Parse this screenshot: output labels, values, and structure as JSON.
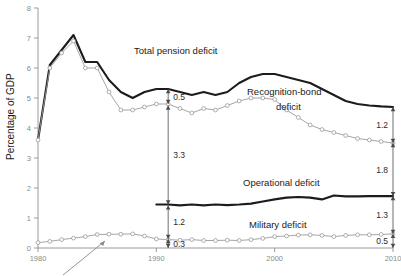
{
  "chart_data": {
    "type": "line",
    "title": "",
    "xlabel": "",
    "ylabel": "Percentage of GDP",
    "xlim": [
      1980,
      2010
    ],
    "ylim": [
      0,
      8
    ],
    "ytick_labels": [
      "0",
      "1",
      "2",
      "3",
      "4",
      "5",
      "6",
      "7",
      "8"
    ],
    "ytick_values": [
      0,
      1,
      2,
      3,
      4,
      5,
      6,
      7,
      8
    ],
    "xtick_labels": [
      "1980",
      "1990",
      "2000",
      "2010"
    ],
    "xtick_values": [
      1980,
      1990,
      2000,
      2010
    ],
    "grid": false,
    "legend_position": "inline-annotations",
    "x": [
      1980,
      1981,
      1982,
      1983,
      1984,
      1985,
      1986,
      1987,
      1988,
      1989,
      1990,
      1991,
      1992,
      1993,
      1994,
      1995,
      1996,
      1997,
      1998,
      1999,
      2000,
      2001,
      2002,
      2003,
      2004,
      2005,
      2006,
      2007,
      2008,
      2009,
      2010
    ],
    "series": [
      {
        "name": "Total pension deficit",
        "style": "thick-black",
        "values": [
          3.6,
          6.1,
          6.6,
          7.1,
          6.2,
          6.2,
          5.6,
          5.2,
          5.0,
          5.2,
          5.3,
          5.3,
          5.2,
          5.1,
          5.2,
          5.1,
          5.2,
          5.5,
          5.7,
          5.8,
          5.8,
          5.7,
          5.6,
          5.5,
          5.3,
          5.1,
          4.9,
          4.8,
          4.75,
          4.72,
          4.7
        ]
      },
      {
        "name": "Recognition-bond deficit",
        "style": "thin-grey-markers",
        "values": [
          3.6,
          6.0,
          6.5,
          6.9,
          6.0,
          6.0,
          5.2,
          4.6,
          4.6,
          4.7,
          4.8,
          4.8,
          4.65,
          4.5,
          4.65,
          4.6,
          4.75,
          4.9,
          5.0,
          5.0,
          4.95,
          4.6,
          4.35,
          4.1,
          3.95,
          3.85,
          3.75,
          3.65,
          3.6,
          3.55,
          3.5
        ]
      },
      {
        "name": "Operational deficit / Military deficit boundary",
        "style": "thick-black",
        "values": [
          null,
          null,
          null,
          null,
          null,
          null,
          null,
          null,
          null,
          null,
          1.45,
          1.45,
          1.42,
          1.45,
          1.42,
          1.45,
          1.43,
          1.45,
          1.48,
          1.55,
          1.62,
          1.68,
          1.7,
          1.68,
          1.62,
          1.75,
          1.72,
          1.72,
          1.73,
          1.73,
          1.73
        ]
      },
      {
        "name": "Military deficit",
        "style": "thin-grey-markers",
        "values": [
          0.18,
          0.22,
          0.28,
          0.33,
          0.38,
          0.45,
          0.46,
          0.46,
          0.47,
          0.4,
          0.3,
          0.28,
          0.26,
          0.28,
          0.25,
          0.25,
          0.26,
          0.25,
          0.28,
          0.32,
          0.38,
          0.4,
          0.43,
          0.44,
          0.42,
          0.38,
          0.42,
          0.44,
          0.44,
          0.45,
          0.47
        ]
      }
    ],
    "annotations": [
      {
        "name": "gap-0-5",
        "label": "0.5",
        "x": 1991,
        "y_top": 5.3,
        "y_bottom": 4.8
      },
      {
        "name": "gap-3-3",
        "label": "3.3",
        "x": 1991,
        "y_top": 4.75,
        "y_bottom": 1.45
      },
      {
        "name": "gap-1-2",
        "label": "1.2",
        "x": 1991,
        "y_top": 1.42,
        "y_bottom": 0.3
      },
      {
        "name": "gap-0-3",
        "label": "0.3",
        "x": 1991,
        "y_top": 0.3,
        "y_bottom": 0.0
      },
      {
        "name": "gap-right-1-2",
        "label": "1.2",
        "x": 2010,
        "y_top": 4.7,
        "y_bottom": 3.5
      },
      {
        "name": "gap-right-1-8",
        "label": "1.8",
        "x": 2010,
        "y_top": 3.5,
        "y_bottom": 1.73
      },
      {
        "name": "gap-right-1-3",
        "label": "1.3",
        "x": 2010,
        "y_top": 1.73,
        "y_bottom": 0.47
      },
      {
        "name": "gap-right-0-5",
        "label": "0.5",
        "x": 2010,
        "y_top": 0.47,
        "y_bottom": 0.0
      }
    ],
    "series_labels": [
      {
        "name": "total-pension-deficit",
        "text": "Total pension deficit"
      },
      {
        "name": "recognition-bond-deficit-line1",
        "text": "Recognition-bond"
      },
      {
        "name": "recognition-bond-deficit-line2",
        "text": "deficit"
      },
      {
        "name": "operational-deficit",
        "text": "Operational deficit"
      },
      {
        "name": "military-deficit",
        "text": "Military deficit"
      }
    ]
  },
  "axis": {
    "y_title": "Percentage of GDP"
  }
}
